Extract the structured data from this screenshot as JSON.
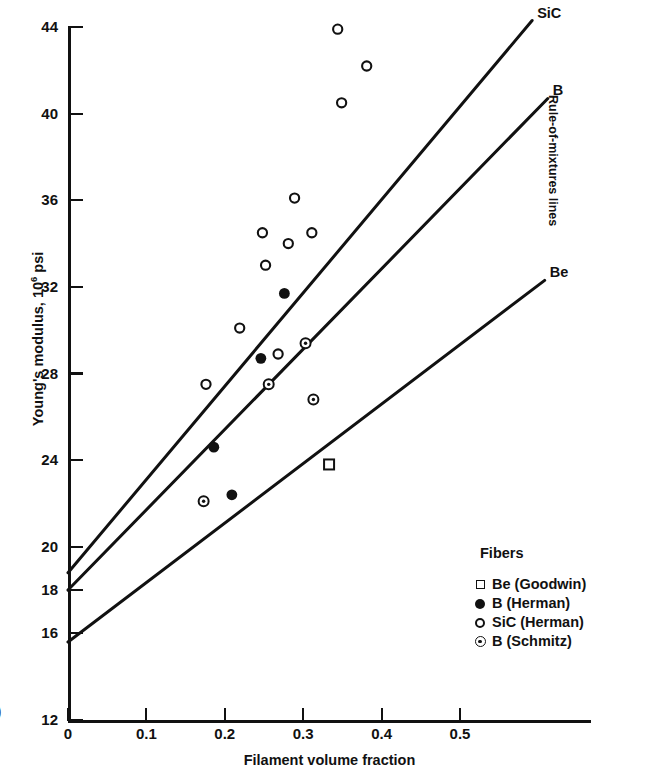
{
  "chart_data": {
    "type": "scatter",
    "title": "",
    "xlabel": "Filament volume fraction",
    "ylabel": "Young's modulus, 10⁶ psi",
    "ylabel_main": "Young's modulus, 10",
    "ylabel_exp": "6",
    "ylabel_unit": " psi",
    "xlim": [
      0,
      0.6
    ],
    "ylim": [
      12,
      44
    ],
    "grid": false,
    "xticks": [
      0,
      0.1,
      0.2,
      0.3,
      0.4,
      0.5
    ],
    "xtick_labels": [
      "0",
      "0.1",
      "0.2",
      "0.3",
      "0.4",
      "0.5"
    ],
    "yticks": [
      12,
      16,
      18,
      20,
      24,
      28,
      32,
      36,
      40,
      44
    ],
    "ytick_labels": [
      "12",
      "16",
      "18",
      "20",
      "24",
      "28",
      "32",
      "36",
      "40",
      "44"
    ],
    "legend_position": "lower-right",
    "annotation": "Rule-of-mixtures lines",
    "series": [
      {
        "name": "Be (Goodwin)",
        "marker": "open-square",
        "points": [
          {
            "x": 0.333,
            "y": 23.8
          }
        ]
      },
      {
        "name": "B (Herman)",
        "marker": "filled-circle",
        "points": [
          {
            "x": 0.186,
            "y": 24.6
          },
          {
            "x": 0.209,
            "y": 22.4
          },
          {
            "x": 0.246,
            "y": 28.7
          },
          {
            "x": 0.276,
            "y": 31.7
          }
        ]
      },
      {
        "name": "SiC (Herman)",
        "marker": "open-circle",
        "points": [
          {
            "x": 0.176,
            "y": 27.5
          },
          {
            "x": 0.219,
            "y": 30.1
          },
          {
            "x": 0.248,
            "y": 34.5
          },
          {
            "x": 0.252,
            "y": 33.0
          },
          {
            "x": 0.268,
            "y": 28.9
          },
          {
            "x": 0.281,
            "y": 34.0
          },
          {
            "x": 0.289,
            "y": 36.1
          },
          {
            "x": 0.311,
            "y": 34.5
          },
          {
            "x": 0.344,
            "y": 43.9
          },
          {
            "x": 0.349,
            "y": 40.5
          },
          {
            "x": 0.381,
            "y": 42.2
          }
        ]
      },
      {
        "name": "B (Schmitz)",
        "marker": "dotted-circle",
        "points": [
          {
            "x": 0.173,
            "y": 22.1
          },
          {
            "x": 0.256,
            "y": 27.5
          },
          {
            "x": 0.303,
            "y": 29.4
          },
          {
            "x": 0.313,
            "y": 26.8
          }
        ]
      }
    ],
    "lines": [
      {
        "name": "SiC",
        "label": "SiC",
        "x0": 0.0,
        "y0": 18.8,
        "x1": 0.592,
        "y1": 44.3
      },
      {
        "name": "B",
        "label": "B",
        "x0": 0.0,
        "y0": 18.0,
        "x1": 0.612,
        "y1": 40.7
      },
      {
        "name": "Be",
        "label": "Be",
        "x0": 0.0,
        "y0": 15.6,
        "x1": 0.608,
        "y1": 32.3
      }
    ]
  },
  "legend": {
    "title": "Fibers",
    "items": [
      {
        "marker": "open-square",
        "label": "Be (Goodwin)"
      },
      {
        "marker": "filled-circle",
        "label": "B (Herman)"
      },
      {
        "marker": "open-circle",
        "label": "SiC (Herman)"
      },
      {
        "marker": "dotted-circle",
        "label": "B (Schmitz)"
      }
    ]
  },
  "page_artifact": ")"
}
